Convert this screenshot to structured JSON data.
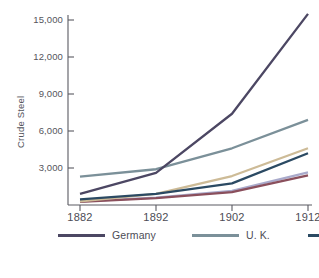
{
  "chart_data": {
    "type": "line",
    "title": "",
    "xlabel": "",
    "ylabel": "Crude Steel",
    "categories": [
      "1882",
      "1892",
      "1902",
      "1912"
    ],
    "x": [
      1882,
      1892,
      1902,
      1912
    ],
    "xlim": [
      1882,
      1912
    ],
    "ylim": [
      0,
      16000
    ],
    "yticks": [
      3000,
      6000,
      9000,
      12000,
      15000
    ],
    "ytick_labels": [
      "3,000",
      "6,000",
      "9,000",
      "12,000",
      "15,000"
    ],
    "grid": false,
    "legend_position": "bottom",
    "series": [
      {
        "name": "Germany",
        "color": "#4c4763",
        "values": [
          900,
          2600,
          7400,
          15500
        ]
      },
      {
        "name": "U. K.",
        "color": "#7b9099",
        "values": [
          2300,
          2900,
          4600,
          6900
        ]
      },
      {
        "name": "France",
        "color": "#2b4a63",
        "values": [
          450,
          900,
          1750,
          4200
        ]
      },
      {
        "name": "Austria",
        "color": "#a9aacb",
        "values": [
          300,
          600,
          1150,
          2650
        ]
      },
      {
        "name": "Russia",
        "color": "#cdbb97",
        "values": [
          300,
          900,
          2350,
          4600
        ]
      },
      {
        "name": "Belgium",
        "color": "#8a4f5c",
        "values": [
          250,
          550,
          1050,
          2400
        ]
      }
    ]
  },
  "axes": {
    "y_axis_label": "Crude Steel",
    "y_tick_labels": [
      "15,000",
      "12,000",
      "9,000",
      "6,000",
      "3,000"
    ],
    "x_tick_labels": [
      "1882",
      "1892",
      "1902",
      "1912"
    ]
  },
  "legend": {
    "items": [
      {
        "label": "Germany",
        "color": "#4c4763"
      },
      {
        "label": "U. K.",
        "color": "#7b9099"
      },
      {
        "label": "France",
        "color": "#2b4a63"
      },
      {
        "label": "Austria",
        "color": "#a9aacb"
      },
      {
        "label": "Russia",
        "color": "#cdbb97"
      },
      {
        "label": "Belgium",
        "color": "#8a4f5c"
      }
    ]
  }
}
